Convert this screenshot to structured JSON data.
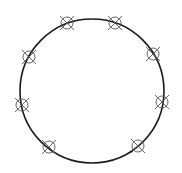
{
  "diagram": {
    "background": "#ffffff",
    "stroke_color": "#1a1a1a",
    "marker_color": "#555555",
    "main_circle": {
      "cx": 92,
      "cy": 91,
      "r": 72
    },
    "markers": [
      {
        "x": 67,
        "y": 23
      },
      {
        "x": 115,
        "y": 23
      },
      {
        "x": 153,
        "y": 54
      },
      {
        "x": 162,
        "y": 102
      },
      {
        "x": 138,
        "y": 146
      },
      {
        "x": 49,
        "y": 147
      },
      {
        "x": 22,
        "y": 105
      },
      {
        "x": 29,
        "y": 57
      }
    ],
    "marker_radius": 6,
    "marker_cross_half": 10
  }
}
